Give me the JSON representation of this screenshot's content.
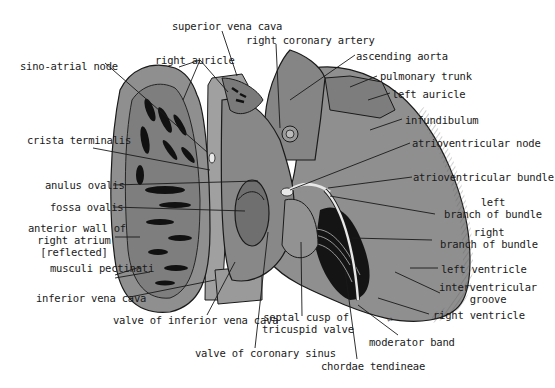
{
  "figure": {
    "colors": {
      "tissue_fill": "#8f8f8f",
      "tissue_dark": "#6e6e6e",
      "tissue_light": "#a8a8a8",
      "pectinate_black": "#111111",
      "line": "#1a1a1a",
      "node_highlight": "#e8e8e8",
      "background": "#ffffff"
    }
  },
  "labels": {
    "superior_vena_cava": "superior vena cava",
    "right_coronary_artery": "right coronary artery",
    "right_auricle": "right auricle",
    "ascending_aorta": "ascending aorta",
    "sino_atrial_node": "sino-atrial node",
    "pulmonary_trunk": "pulmonary trunk",
    "left_auricle": "left auricle",
    "infundibulum": "infundibulum",
    "crista_terminalis": "crista terminalis",
    "atrioventricular_node": "atrioventricular node",
    "anulus_ovalis": "anulus ovalis",
    "atrioventricular_bundle": "atrioventricular bundle",
    "fossa_ovalis": "fossa ovalis",
    "left_branch_line1": "left",
    "left_branch_line2": "branch of bundle",
    "anterior_wall_line1": "anterior wall of",
    "anterior_wall_line2": "right atrium",
    "anterior_wall_line3": "[reflected]",
    "right_branch_line1": "right",
    "right_branch_line2": "branch of bundle",
    "musculi_pectinati": "musculi pectinati",
    "left_ventricle": "left ventricle",
    "interventricular_line1": "interventricular",
    "interventricular_line2": "groove",
    "inferior_vena_cava": "inferior vena cava",
    "septal_cusp_line1": "septal cusp of",
    "septal_cusp_line2": "tricuspid valve",
    "right_ventricle": "right ventricle",
    "valve_inferior_vena_cava": "valve of inferior vena cava",
    "moderator_band": "moderator band",
    "valve_coronary_sinus": "valve of coronary sinus",
    "chordae_tendineae": "chordae tendineae"
  }
}
